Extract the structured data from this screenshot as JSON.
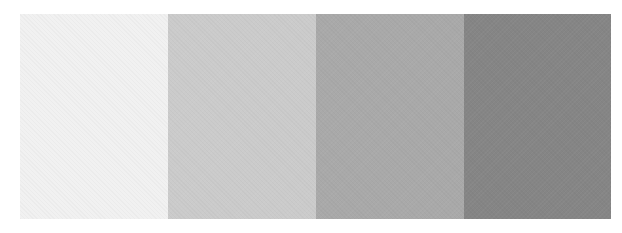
{
  "palette": {
    "swatches": [
      {
        "name": "swatch-1",
        "color": "#f1f1f1",
        "width": 148
      },
      {
        "name": "swatch-2",
        "color": "#cbcbcb",
        "width": 148
      },
      {
        "name": "swatch-3",
        "color": "#a9a9a9",
        "width": 148
      },
      {
        "name": "swatch-4",
        "color": "#858585",
        "width": 147
      }
    ]
  }
}
